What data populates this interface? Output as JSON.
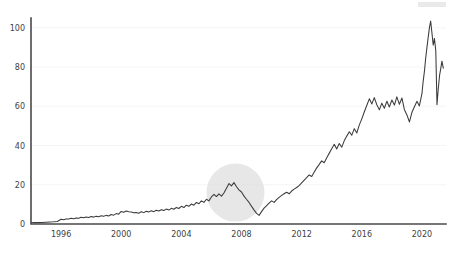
{
  "chart_data": {
    "type": "line",
    "title": "",
    "subtitle": "",
    "xlabel": "",
    "ylabel": "",
    "xlim": [
      1994.0,
      2021.6
    ],
    "ylim": [
      0,
      105
    ],
    "grid": true,
    "legend": null,
    "legend_position": "none",
    "x_ticks": [
      1996,
      2000,
      2004,
      2008,
      2012,
      2016,
      2020
    ],
    "x_tick_labels": [
      "1996",
      "2000",
      "2004",
      "2008",
      "2012",
      "2016",
      "2020"
    ],
    "y_ticks": [
      0,
      20,
      40,
      60,
      80,
      100
    ],
    "y_tick_labels": [
      "0",
      "20",
      "40",
      "60",
      "80",
      "100"
    ],
    "line_color": "#3b3b3b",
    "background_color": "#ffffff",
    "gridline_color": "#f4f2f4",
    "axis_color": "#4a4a4a",
    "annotations": [
      {
        "name": "crisis-highlight",
        "shape": "circle",
        "center_x": 2007.6,
        "center_y": 16.0,
        "radius_px": 29,
        "color": "#d9d9d9",
        "opacity": 0.62,
        "label": ""
      }
    ],
    "series": [
      {
        "name": "price",
        "x": [
          1994.0,
          1994.25,
          1994.5,
          1994.75,
          1995.0,
          1995.25,
          1995.5,
          1995.75,
          1996.0,
          1996.17,
          1996.33,
          1996.5,
          1996.67,
          1996.83,
          1997.0,
          1997.17,
          1997.33,
          1997.5,
          1997.67,
          1997.83,
          1998.0,
          1998.17,
          1998.33,
          1998.5,
          1998.67,
          1998.83,
          1999.0,
          1999.17,
          1999.33,
          1999.5,
          1999.67,
          1999.83,
          2000.0,
          2000.17,
          2000.33,
          2000.5,
          2000.67,
          2000.83,
          2001.0,
          2001.17,
          2001.33,
          2001.5,
          2001.67,
          2001.83,
          2002.0,
          2002.17,
          2002.33,
          2002.5,
          2002.67,
          2002.83,
          2003.0,
          2003.17,
          2003.33,
          2003.5,
          2003.67,
          2003.83,
          2004.0,
          2004.17,
          2004.33,
          2004.5,
          2004.67,
          2004.83,
          2005.0,
          2005.17,
          2005.33,
          2005.5,
          2005.67,
          2005.83,
          2006.0,
          2006.17,
          2006.33,
          2006.5,
          2006.67,
          2006.83,
          2007.0,
          2007.17,
          2007.33,
          2007.5,
          2007.67,
          2007.83,
          2008.0,
          2008.17,
          2008.33,
          2008.5,
          2008.67,
          2008.83,
          2009.0,
          2009.17,
          2009.33,
          2009.5,
          2009.67,
          2009.83,
          2010.0,
          2010.17,
          2010.33,
          2010.5,
          2010.67,
          2010.83,
          2011.0,
          2011.17,
          2011.33,
          2011.5,
          2011.67,
          2011.83,
          2012.0,
          2012.17,
          2012.33,
          2012.5,
          2012.67,
          2012.83,
          2013.0,
          2013.17,
          2013.33,
          2013.5,
          2013.67,
          2013.83,
          2014.0,
          2014.17,
          2014.33,
          2014.5,
          2014.67,
          2014.83,
          2015.0,
          2015.17,
          2015.33,
          2015.5,
          2015.67,
          2015.83,
          2016.0,
          2016.17,
          2016.33,
          2016.5,
          2016.67,
          2016.83,
          2017.0,
          2017.17,
          2017.33,
          2017.5,
          2017.67,
          2017.83,
          2018.0,
          2018.17,
          2018.33,
          2018.5,
          2018.67,
          2018.83,
          2019.0,
          2019.17,
          2019.33,
          2019.5,
          2019.67,
          2019.83,
          2020.0,
          2020.08,
          2020.17,
          2020.25,
          2020.33,
          2020.42,
          2020.5,
          2020.58,
          2020.67,
          2020.75,
          2020.83,
          2020.92,
          2021.0,
          2021.08,
          2021.17,
          2021.25,
          2021.33,
          2021.42
        ],
        "values": [
          0.6,
          0.7,
          0.7,
          0.8,
          0.9,
          1.0,
          1.1,
          1.3,
          2.4,
          2.2,
          2.6,
          2.5,
          2.9,
          2.7,
          3.1,
          2.9,
          3.4,
          3.2,
          3.6,
          3.3,
          3.8,
          3.5,
          4.0,
          3.7,
          4.2,
          3.9,
          4.4,
          4.1,
          4.8,
          4.5,
          5.3,
          5.0,
          6.4,
          6.0,
          6.6,
          6.2,
          6.1,
          5.7,
          5.9,
          5.5,
          6.3,
          5.8,
          6.5,
          6.1,
          6.8,
          6.3,
          7.0,
          6.6,
          7.3,
          6.9,
          7.6,
          7.1,
          8.0,
          7.5,
          8.4,
          7.9,
          9.0,
          8.4,
          9.6,
          9.0,
          10.2,
          9.6,
          11.0,
          10.3,
          11.8,
          11.0,
          12.6,
          11.8,
          13.8,
          15.1,
          14.0,
          15.4,
          14.2,
          15.8,
          18.2,
          20.6,
          19.4,
          21.1,
          19.0,
          17.4,
          16.3,
          14.2,
          12.6,
          11.0,
          9.0,
          7.2,
          5.4,
          4.4,
          6.3,
          8.1,
          9.4,
          10.6,
          11.8,
          11.0,
          12.4,
          13.6,
          14.6,
          15.4,
          16.2,
          15.4,
          16.8,
          17.8,
          18.6,
          19.6,
          21.0,
          22.4,
          23.6,
          25.0,
          24.2,
          26.4,
          28.6,
          30.4,
          32.2,
          31.2,
          33.8,
          36.0,
          38.4,
          40.6,
          38.2,
          41.0,
          39.2,
          42.4,
          44.8,
          47.0,
          45.2,
          48.6,
          46.4,
          50.4,
          53.6,
          57.2,
          60.4,
          63.8,
          61.2,
          64.4,
          60.8,
          58.2,
          61.6,
          59.0,
          62.6,
          59.6,
          63.2,
          60.6,
          64.8,
          61.0,
          64.2,
          58.4,
          55.6,
          52.0,
          56.8,
          59.8,
          62.6,
          60.2,
          66.4,
          72.6,
          78.2,
          84.6,
          89.8,
          95.4,
          100.2,
          103.4,
          97.0,
          91.2,
          94.6,
          88.4,
          60.8,
          68.4,
          75.6,
          79.2,
          83.0,
          79.4
        ]
      }
    ]
  }
}
